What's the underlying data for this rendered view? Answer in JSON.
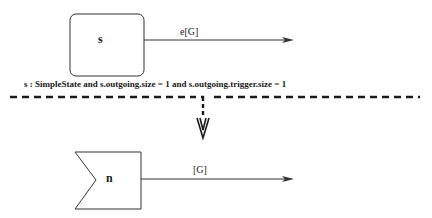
{
  "diagram": {
    "top": {
      "state_name": "s",
      "transition_label": "e[G]"
    },
    "condition": "s : SimpleState  and  s.outgoing.size = 1  and  s.outgoing.trigger.size = 1",
    "bottom": {
      "state_name": "n",
      "transition_label": "[G]"
    },
    "colors": {
      "stroke": "#333333",
      "dash": "#1a1a1a",
      "background": "#ffffff"
    }
  }
}
